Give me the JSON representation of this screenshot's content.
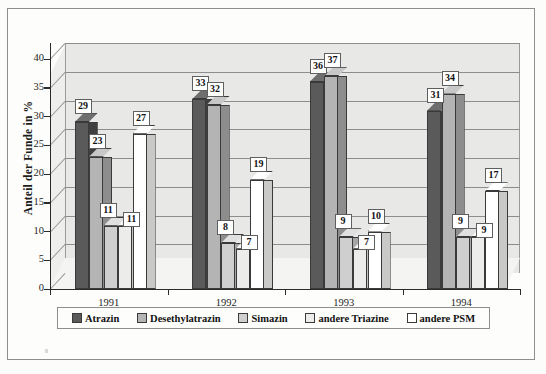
{
  "chart_data": {
    "type": "bar",
    "title": "",
    "subtitle": "",
    "xlabel": "",
    "ylabel": "Anteil der Funde in %",
    "categories": [
      "1991",
      "1992",
      "1993",
      "1994"
    ],
    "series": [
      {
        "name": "Atrazin",
        "values": [
          29,
          33,
          36,
          31
        ],
        "color": "#5a5a5a"
      },
      {
        "name": "Desethylatrazin",
        "values": [
          23,
          32,
          37,
          34
        ],
        "color": "#b4b4b4"
      },
      {
        "name": "Simazin",
        "values": [
          11,
          8,
          9,
          9
        ],
        "color": "#cfcfcf"
      },
      {
        "name": "andere Triazine",
        "values": [
          11,
          7,
          7,
          9
        ],
        "color": "#ececea"
      },
      {
        "name": "andere PSM",
        "values": [
          27,
          19,
          10,
          17
        ],
        "color": "#ffffff"
      }
    ],
    "ylim": [
      0,
      40
    ],
    "yticks": [
      0,
      5,
      10,
      15,
      20,
      25,
      30,
      35,
      40
    ],
    "ytick_labels": [
      "0",
      "5",
      "10",
      "15",
      "20",
      "25",
      "30",
      "35",
      "40"
    ],
    "grid": true,
    "legend_position": "bottom",
    "three_d": true,
    "data_labels": true
  },
  "legend": {
    "items": [
      {
        "label": "Atrazin"
      },
      {
        "label": "Desethylatrazin"
      },
      {
        "label": "Simazin"
      },
      {
        "label": "andere Triazine"
      },
      {
        "label": "andere PSM"
      }
    ]
  }
}
